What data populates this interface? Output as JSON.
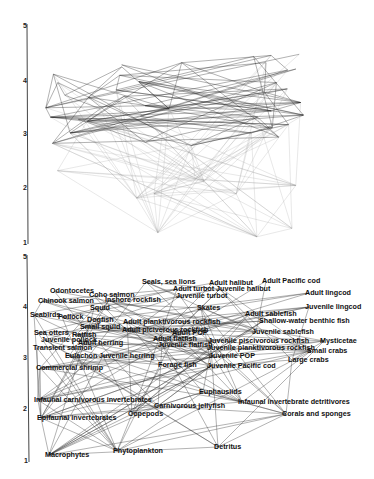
{
  "figure": {
    "title": ""
  },
  "top_panel": {
    "axis": {
      "ticks": [
        "5",
        "4",
        "3",
        "2",
        "1"
      ],
      "range": [
        1,
        5
      ]
    }
  },
  "bottom_panel": {
    "axis": {
      "ticks": [
        "5",
        "4",
        "3",
        "2",
        "1"
      ],
      "range": [
        1,
        5
      ]
    },
    "nodes": [
      {
        "label": "Seals, sea lions",
        "x": 142,
        "y": 284
      },
      {
        "label": "Adult halibut",
        "x": 209,
        "y": 285
      },
      {
        "label": "Adult Pacific cod",
        "x": 262,
        "y": 283
      },
      {
        "label": "Odontocetes",
        "x": 50,
        "y": 293
      },
      {
        "label": "Coho salmon",
        "x": 89,
        "y": 297
      },
      {
        "label": "Adult turbot",
        "x": 173,
        "y": 291
      },
      {
        "label": "Juvenile halibut",
        "x": 216,
        "y": 291
      },
      {
        "label": "Chinook salmon",
        "x": 38,
        "y": 303
      },
      {
        "label": "Inshore rockfish",
        "x": 105,
        "y": 302
      },
      {
        "label": "Juvenile turbot",
        "x": 176,
        "y": 298
      },
      {
        "label": "Adult lingcod",
        "x": 305,
        "y": 295
      },
      {
        "label": "Squid",
        "x": 90,
        "y": 310
      },
      {
        "label": "Skates",
        "x": 197,
        "y": 310
      },
      {
        "label": "Juvenile lingcod",
        "x": 305,
        "y": 309
      },
      {
        "label": "Seabirds",
        "x": 30,
        "y": 317
      },
      {
        "label": "Pollock",
        "x": 58,
        "y": 319
      },
      {
        "label": "Adult sablefish",
        "x": 245,
        "y": 316
      },
      {
        "label": "Dogfish",
        "x": 87,
        "y": 322
      },
      {
        "label": "Adult planktivorous rockfish",
        "x": 123,
        "y": 324
      },
      {
        "label": "Shallow-water benthic fish",
        "x": 259,
        "y": 323
      },
      {
        "label": "Small squid",
        "x": 80,
        "y": 329
      },
      {
        "label": "Adult piciverous rockfish",
        "x": 122,
        "y": 332
      },
      {
        "label": "Juvenile sablefish",
        "x": 252,
        "y": 334
      },
      {
        "label": "Sea otters",
        "x": 34,
        "y": 335
      },
      {
        "label": "Ratfish",
        "x": 72,
        "y": 337
      },
      {
        "label": "Adult POP",
        "x": 172,
        "y": 335
      },
      {
        "label": "Juvenile pollock",
        "x": 41,
        "y": 342
      },
      {
        "label": "Adult flatfish",
        "x": 153,
        "y": 341
      },
      {
        "label": "Juvenile piscivorous rockfish",
        "x": 208,
        "y": 343
      },
      {
        "label": "Mysticetae",
        "x": 320,
        "y": 343
      },
      {
        "label": "Adult herring",
        "x": 78,
        "y": 345
      },
      {
        "label": "Juvenile flatfish",
        "x": 158,
        "y": 347
      },
      {
        "label": "Juvenile planktivorous rockfish",
        "x": 207,
        "y": 350
      },
      {
        "label": "Small crabs",
        "x": 307,
        "y": 353
      },
      {
        "label": "Transient salmon",
        "x": 33,
        "y": 350
      },
      {
        "label": "Juvenile POP",
        "x": 209,
        "y": 358
      },
      {
        "label": "Eulachon",
        "x": 65,
        "y": 358
      },
      {
        "label": "Juvenile herring",
        "x": 99,
        "y": 358
      },
      {
        "label": "Large crabs",
        "x": 288,
        "y": 362
      },
      {
        "label": "Forage fish",
        "x": 158,
        "y": 367
      },
      {
        "label": "Juvenile Pacific cod",
        "x": 207,
        "y": 368
      },
      {
        "label": "Commercial shrimp",
        "x": 36,
        "y": 370
      },
      {
        "label": "Euphausiids",
        "x": 199,
        "y": 394
      },
      {
        "label": "Infaunal carnivorous invertebrates",
        "x": 34,
        "y": 402
      },
      {
        "label": "Infaunal invertebrate detritivores",
        "x": 238,
        "y": 404
      },
      {
        "label": "Carnivorous jellyfish",
        "x": 154,
        "y": 408
      },
      {
        "label": "Copepods",
        "x": 128,
        "y": 416
      },
      {
        "label": "Corals and sponges",
        "x": 282,
        "y": 416
      },
      {
        "label": "Epifaunal invertebrates",
        "x": 37,
        "y": 420
      },
      {
        "label": "Detritus",
        "x": 214,
        "y": 449
      },
      {
        "label": "Phytoplankton",
        "x": 113,
        "y": 453
      },
      {
        "label": "Macrophytes",
        "x": 45,
        "y": 457
      }
    ]
  },
  "colors": {
    "background": "#ffffff",
    "edge_dark": "#1a1a1a",
    "edge_light": "#b8b8b8",
    "axis": "#333333",
    "label": "#111111"
  }
}
